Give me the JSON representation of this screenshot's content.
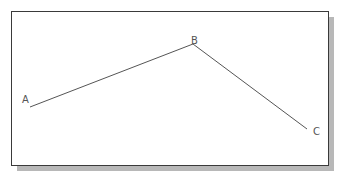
{
  "diagram": {
    "type": "polyline",
    "line_color": "#555555",
    "frame_border_color": "#3a3a3a",
    "shadow_color": "#b8b8b8",
    "points": [
      {
        "label": "A",
        "x": 30,
        "y": 107,
        "label_x": 22,
        "label_y": 103
      },
      {
        "label": "B",
        "x": 193,
        "y": 44,
        "label_x": 191,
        "label_y": 44
      },
      {
        "label": "C",
        "x": 307,
        "y": 129,
        "label_x": 313,
        "label_y": 135
      }
    ],
    "segments": [
      {
        "from": "A",
        "to": "B"
      },
      {
        "from": "B",
        "to": "C"
      }
    ]
  }
}
